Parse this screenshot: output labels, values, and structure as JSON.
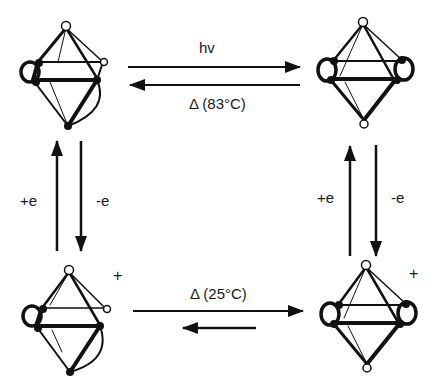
{
  "diagram": {
    "type": "reaction-scheme",
    "colors": {
      "ink": "#111111",
      "background": "#ffffff"
    },
    "nodes": [
      {
        "id": "top-left",
        "label": "neutral cluster isomer A",
        "charge": ""
      },
      {
        "id": "top-right",
        "label": "neutral cluster isomer B",
        "charge": ""
      },
      {
        "id": "bottom-left",
        "label": "cation cluster isomer A",
        "charge": "+"
      },
      {
        "id": "bottom-right",
        "label": "cation cluster isomer B",
        "charge": "+"
      }
    ],
    "edges": {
      "top_forward_label": "hv",
      "top_reverse_label": "Δ (83°C)",
      "bottom_forward_label": "Δ (25°C)",
      "left_up_label": "+e",
      "left_down_label": "-e",
      "right_up_label": "+e",
      "right_down_label": "-e"
    },
    "charges": {
      "bottom_left": "+",
      "bottom_right": "+"
    }
  }
}
